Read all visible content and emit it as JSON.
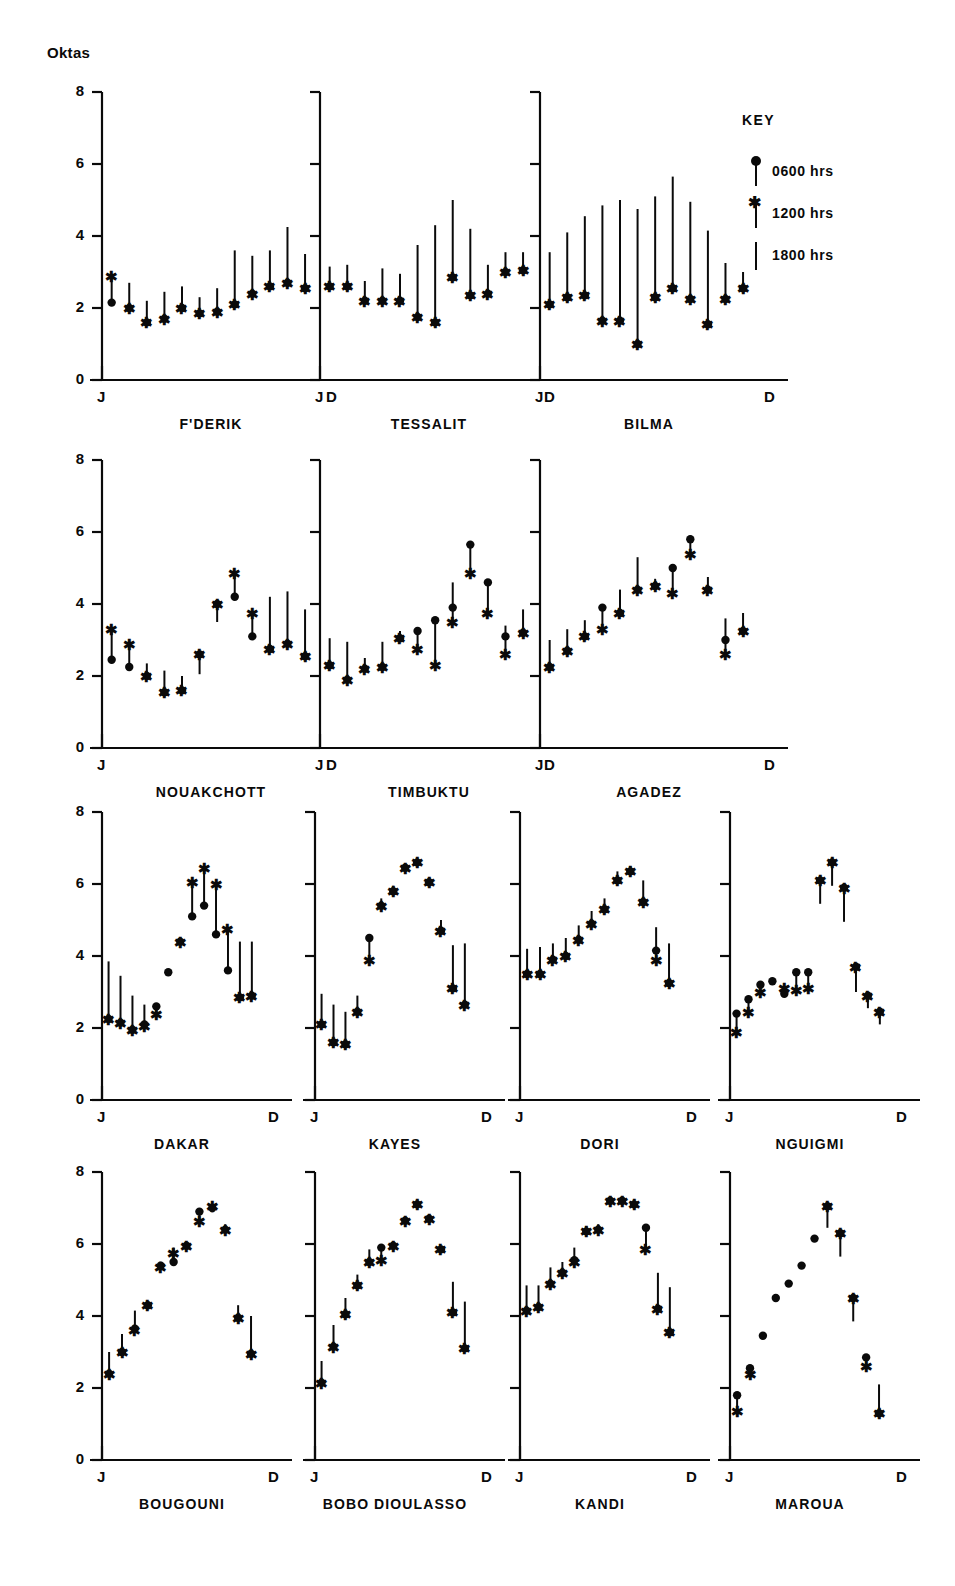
{
  "figure": {
    "y_axis_title": "Oktas",
    "y_ticks": [
      "0",
      "2",
      "4",
      "6",
      "8"
    ],
    "x_tick_start": "J",
    "x_tick_end": "D"
  },
  "key": {
    "title": "KEY",
    "entries": [
      {
        "marker": "dot",
        "label": "0600 hrs"
      },
      {
        "marker": "star",
        "label": "1200 hrs"
      },
      {
        "marker": "line",
        "label": "1800 hrs"
      }
    ]
  },
  "chart_data": {
    "type": "line",
    "ylabel": "Oktas",
    "xlabel": "",
    "ylim": [
      0,
      8
    ],
    "ytick_values": [
      0,
      2,
      4,
      6,
      8
    ],
    "grid": false,
    "legend_position": "top-right",
    "x": [
      "J",
      "F",
      "M",
      "A",
      "M",
      "J",
      "J",
      "A",
      "S",
      "O",
      "N",
      "D"
    ],
    "series_names": [
      "0600 hrs",
      "1200 hrs",
      "1800 hrs"
    ],
    "panel_layout": [
      3,
      3,
      4,
      4
    ],
    "panels": [
      {
        "name": "F'DERIK",
        "series": [
          {
            "name": "0600 hrs",
            "values": [
              2.15,
              2.0,
              1.6,
              1.7,
              2.0,
              1.85,
              1.9,
              2.1,
              2.4,
              2.6,
              2.7,
              2.55
            ]
          },
          {
            "name": "1200 hrs",
            "values": [
              2.9,
              2.0,
              1.6,
              1.7,
              2.0,
              1.85,
              1.9,
              2.1,
              2.4,
              2.6,
              2.7,
              2.55
            ]
          },
          {
            "name": "1800 hrs",
            "values": [
              2.95,
              2.7,
              2.2,
              2.45,
              2.6,
              2.3,
              2.55,
              3.6,
              3.45,
              3.6,
              4.25,
              3.5
            ]
          }
        ]
      },
      {
        "name": "TESSALIT",
        "series": [
          {
            "name": "0600 hrs",
            "values": [
              2.6,
              2.6,
              2.2,
              2.2,
              2.2,
              1.75,
              1.6,
              2.85,
              2.35,
              2.4,
              3.0,
              3.05
            ]
          },
          {
            "name": "1200 hrs",
            "values": [
              2.6,
              2.6,
              2.2,
              2.2,
              2.2,
              1.75,
              1.6,
              2.85,
              2.35,
              2.4,
              3.0,
              3.05
            ]
          },
          {
            "name": "1800 hrs",
            "values": [
              3.15,
              3.2,
              2.75,
              3.1,
              2.95,
              3.75,
              4.3,
              5.0,
              4.2,
              3.2,
              3.55,
              3.55
            ]
          }
        ]
      },
      {
        "name": "BILMA",
        "series": [
          {
            "name": "0600 hrs",
            "values": [
              2.1,
              2.3,
              2.35,
              1.65,
              1.65,
              1.0,
              2.3,
              2.55,
              2.25,
              1.55,
              2.25,
              2.55
            ]
          },
          {
            "name": "1200 hrs",
            "values": [
              2.1,
              2.3,
              2.35,
              1.65,
              1.65,
              1.0,
              2.3,
              2.55,
              2.25,
              1.55,
              2.25,
              2.55
            ]
          },
          {
            "name": "1800 hrs",
            "values": [
              3.55,
              4.1,
              4.55,
              4.85,
              5.0,
              4.75,
              5.1,
              5.65,
              4.95,
              4.15,
              3.25,
              3.0
            ]
          }
        ]
      },
      {
        "name": "NOUAKCHOTT",
        "series": [
          {
            "name": "0600 hrs",
            "values": [
              2.45,
              2.25,
              2.0,
              1.55,
              1.6,
              2.6,
              4.0,
              4.2,
              3.1,
              2.75,
              2.9,
              2.55
            ]
          },
          {
            "name": "1200 hrs",
            "values": [
              3.3,
              2.9,
              2.0,
              1.55,
              1.6,
              2.6,
              4.0,
              4.85,
              3.75,
              2.75,
              2.9,
              2.55
            ]
          },
          {
            "name": "1800 hrs",
            "values": [
              3.35,
              2.95,
              2.35,
              2.15,
              2.0,
              2.05,
              3.5,
              4.9,
              3.8,
              4.2,
              4.35,
              3.85
            ]
          }
        ]
      },
      {
        "name": "TIMBUKTU",
        "series": [
          {
            "name": "0600 hrs",
            "values": [
              2.3,
              1.9,
              2.2,
              2.25,
              3.05,
              3.25,
              3.55,
              3.9,
              5.65,
              4.6,
              3.1,
              3.2
            ]
          },
          {
            "name": "1200 hrs",
            "values": [
              2.3,
              1.9,
              2.2,
              2.25,
              3.05,
              2.75,
              2.3,
              3.5,
              4.85,
              3.75,
              2.6,
              3.2
            ]
          },
          {
            "name": "1800 hrs",
            "values": [
              3.05,
              2.95,
              2.5,
              2.95,
              3.25,
              3.35,
              3.55,
              4.6,
              5.7,
              4.65,
              3.4,
              3.85
            ]
          }
        ]
      },
      {
        "name": "AGADEZ",
        "series": [
          {
            "name": "0600 hrs",
            "values": [
              2.25,
              2.7,
              3.1,
              3.9,
              3.75,
              4.4,
              4.5,
              5.0,
              5.8,
              4.4,
              3.0,
              3.25
            ]
          },
          {
            "name": "1200 hrs",
            "values": [
              2.25,
              2.7,
              3.1,
              3.3,
              3.75,
              4.4,
              4.5,
              4.3,
              5.4,
              4.4,
              2.6,
              3.25
            ]
          },
          {
            "name": "1800 hrs",
            "values": [
              3.0,
              3.3,
              3.55,
              4.0,
              4.4,
              5.3,
              4.7,
              5.1,
              5.9,
              4.75,
              3.6,
              3.75
            ]
          }
        ]
      },
      {
        "name": "DAKAR",
        "series": [
          {
            "name": "0600 hrs",
            "values": [
              2.25,
              2.15,
              1.95,
              2.1,
              2.6,
              3.55,
              4.4,
              5.1,
              5.4,
              4.6,
              3.6,
              2.85,
              2.9
            ]
          },
          {
            "name": "1200 hrs",
            "values": [
              2.25,
              2.15,
              1.95,
              2.05,
              2.4,
              3.55,
              4.4,
              6.05,
              6.45,
              6.0,
              4.75,
              2.85,
              2.9
            ]
          },
          {
            "name": "1800 hrs",
            "values": [
              3.85,
              3.45,
              2.9,
              2.65,
              2.6,
              3.55,
              4.5,
              6.1,
              6.5,
              6.05,
              4.75,
              4.4,
              4.4
            ]
          }
        ]
      },
      {
        "name": "KAYES",
        "series": [
          {
            "name": "0600 hrs",
            "values": [
              2.1,
              1.6,
              1.55,
              2.45,
              4.5,
              5.4,
              5.8,
              6.45,
              6.6,
              6.05,
              4.7,
              3.1,
              2.65
            ]
          },
          {
            "name": "1200 hrs",
            "values": [
              2.1,
              1.6,
              1.55,
              2.45,
              3.9,
              5.4,
              5.8,
              6.45,
              6.6,
              6.05,
              4.7,
              3.1,
              2.65
            ]
          },
          {
            "name": "1800 hrs",
            "values": [
              2.95,
              2.65,
              2.45,
              2.9,
              4.55,
              5.6,
              5.95,
              6.5,
              6.65,
              6.1,
              5.0,
              4.3,
              4.35
            ]
          }
        ]
      },
      {
        "name": "DORI",
        "series": [
          {
            "name": "0600 hrs",
            "values": [
              3.5,
              3.5,
              3.9,
              4.0,
              4.45,
              4.9,
              5.3,
              6.1,
              6.35,
              5.5,
              4.15,
              3.25
            ]
          },
          {
            "name": "1200 hrs",
            "values": [
              3.5,
              3.5,
              3.9,
              4.0,
              4.45,
              4.9,
              5.3,
              6.1,
              6.35,
              5.5,
              3.9,
              3.25
            ]
          },
          {
            "name": "1800 hrs",
            "values": [
              4.2,
              4.25,
              4.35,
              4.5,
              4.85,
              5.25,
              5.6,
              6.35,
              6.5,
              6.1,
              4.8,
              4.35
            ]
          }
        ]
      },
      {
        "name": "NGUIGMI",
        "series": [
          {
            "name": "0600 hrs",
            "values": [
              2.4,
              2.8,
              3.2,
              3.3,
              2.95,
              3.55,
              3.55,
              6.1,
              6.6,
              5.9,
              3.7,
              2.9,
              2.45
            ]
          },
          {
            "name": "1200 hrs",
            "values": [
              1.9,
              2.45,
              3.0,
              3.3,
              3.1,
              3.05,
              3.1,
              6.1,
              6.6,
              5.9,
              3.7,
              2.9,
              2.45
            ]
          },
          {
            "name": "1800 hrs",
            "values": [
              2.4,
              2.8,
              3.2,
              3.3,
              2.95,
              3.55,
              3.55,
              5.45,
              5.95,
              4.95,
              3.0,
              2.55,
              2.1
            ]
          }
        ]
      },
      {
        "name": "BOUGOUNI",
        "series": [
          {
            "name": "0600 hrs",
            "values": [
              2.4,
              3.0,
              3.65,
              4.3,
              5.4,
              5.5,
              5.95,
              6.9,
              7.0,
              6.4,
              3.95,
              2.95
            ]
          },
          {
            "name": "1200 hrs",
            "values": [
              2.4,
              3.0,
              3.6,
              4.3,
              5.35,
              5.75,
              5.95,
              6.65,
              7.05,
              6.4,
              3.95,
              2.95
            ]
          },
          {
            "name": "1800 hrs",
            "values": [
              3.0,
              3.5,
              4.15,
              4.4,
              5.45,
              5.9,
              6.0,
              6.9,
              7.05,
              6.55,
              4.3,
              4.0
            ]
          }
        ]
      },
      {
        "name": "BOBO  DIOULASSO",
        "series": [
          {
            "name": "0600 hrs",
            "values": [
              2.15,
              3.15,
              4.05,
              4.85,
              5.5,
              5.9,
              5.95,
              6.65,
              7.1,
              6.7,
              5.85,
              4.1,
              3.1
            ]
          },
          {
            "name": "1200 hrs",
            "values": [
              2.15,
              3.15,
              4.05,
              4.85,
              5.5,
              5.55,
              5.95,
              6.65,
              7.1,
              6.7,
              5.85,
              4.1,
              3.1
            ]
          },
          {
            "name": "1800 hrs",
            "values": [
              2.75,
              3.75,
              4.5,
              5.15,
              5.85,
              5.9,
              6.05,
              6.75,
              7.15,
              6.75,
              5.9,
              4.95,
              4.4
            ]
          }
        ]
      },
      {
        "name": "KANDI",
        "series": [
          {
            "name": "0600 hrs",
            "values": [
              4.15,
              4.25,
              4.9,
              5.2,
              5.55,
              6.35,
              6.4,
              7.2,
              7.2,
              7.1,
              6.45,
              4.2,
              3.55
            ]
          },
          {
            "name": "1200 hrs",
            "values": [
              4.15,
              4.25,
              4.9,
              5.2,
              5.5,
              6.35,
              6.4,
              7.2,
              7.2,
              7.1,
              5.85,
              4.2,
              3.55
            ]
          },
          {
            "name": "1800 hrs",
            "values": [
              4.85,
              4.85,
              5.35,
              5.5,
              5.9,
              6.5,
              6.55,
              7.25,
              7.3,
              7.2,
              6.5,
              5.2,
              4.8
            ]
          }
        ]
      },
      {
        "name": "MAROUA",
        "series": [
          {
            "name": "0600 hrs",
            "values": [
              1.8,
              2.55,
              3.45,
              4.5,
              4.9,
              5.4,
              6.15,
              7.05,
              6.3,
              4.5,
              2.85,
              1.3
            ]
          },
          {
            "name": "1200 hrs",
            "values": [
              1.35,
              2.4,
              3.45,
              4.5,
              4.9,
              5.4,
              6.15,
              7.05,
              6.3,
              4.5,
              2.6,
              1.3
            ]
          },
          {
            "name": "1800 hrs",
            "values": [
              1.8,
              2.55,
              3.45,
              4.5,
              4.9,
              5.4,
              6.15,
              6.45,
              5.65,
              3.85,
              2.85,
              2.1
            ]
          }
        ]
      }
    ]
  }
}
